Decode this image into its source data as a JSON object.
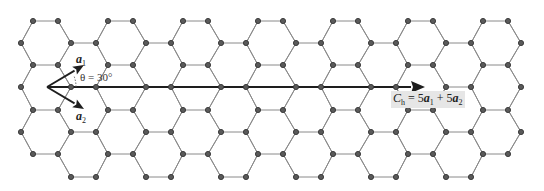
{
  "figure": {
    "type": "graphene-lattice-chiral-vector",
    "colors": {
      "background": "#ffffff",
      "bond": "#8a8a8a",
      "atom_fill": "#5a5a5a",
      "atom_stroke": "#333333",
      "vector": "#1e1e1e",
      "label_bg": "#e6e6e6"
    },
    "lattice": {
      "bond_length_px": 25,
      "period_x_px": 75,
      "row_spacing_px": 22.2,
      "rows": [
        {
          "y": 21,
          "type": "A",
          "x": [
            33,
            58,
            108,
            133,
            183,
            208,
            258,
            283,
            333,
            358,
            408,
            433,
            483,
            508
          ]
        },
        {
          "y": 43,
          "type": "B",
          "x": [
            21,
            71,
            96,
            146,
            171,
            221,
            246,
            296,
            321,
            371,
            396,
            446,
            471,
            521
          ]
        },
        {
          "y": 65,
          "type": "A",
          "x": [
            33,
            58,
            108,
            133,
            183,
            208,
            258,
            283,
            333,
            358,
            408,
            433,
            483,
            508
          ]
        },
        {
          "y": 87,
          "type": "B",
          "x": [
            21,
            71,
            96,
            146,
            171,
            221,
            246,
            296,
            321,
            371,
            396,
            446,
            471,
            521
          ]
        },
        {
          "y": 110,
          "type": "A",
          "x": [
            33,
            58,
            108,
            133,
            183,
            208,
            258,
            283,
            333,
            358,
            408,
            433,
            483,
            508
          ]
        },
        {
          "y": 132,
          "type": "B",
          "x": [
            21,
            71,
            96,
            146,
            171,
            221,
            246,
            296,
            321,
            371,
            396,
            446,
            471,
            521
          ]
        },
        {
          "y": 154,
          "type": "A",
          "x": [
            33,
            58,
            108,
            133,
            183,
            208,
            258,
            283,
            333,
            358,
            408,
            433,
            483,
            508
          ]
        },
        {
          "y": 177,
          "type": "B",
          "x": [
            71,
            96,
            146,
            171,
            221,
            246,
            296,
            321,
            371,
            396,
            446,
            471
          ]
        }
      ]
    },
    "vectors": {
      "origin": [
        47,
        87
      ],
      "a1": {
        "label": "a",
        "subscript": "1",
        "end": [
          84,
          65
        ]
      },
      "a2": {
        "label": "a",
        "subscript": "2",
        "end": [
          84,
          109
        ]
      },
      "ch": {
        "end": [
          425,
          87
        ]
      }
    },
    "labels": {
      "theta": "θ = 30°",
      "ch_symbol": "C",
      "ch_subscript": "h",
      "ch_eq": " = 5",
      "ch_a1": "a",
      "ch_a1_sub": "1",
      "ch_plus": " + 5",
      "ch_a2": "a",
      "ch_a2_sub": "2"
    }
  }
}
